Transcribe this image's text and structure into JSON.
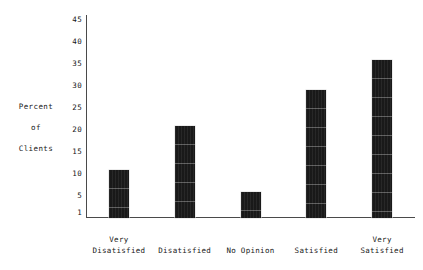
{
  "chart_data": {
    "type": "bar",
    "title": "",
    "subtitle": "",
    "xlabel": "",
    "ylabel": "Percent of Clients",
    "ylabel_lines": [
      "Percent",
      "of",
      "Clients"
    ],
    "categories": [
      "Very Disatisfied",
      "Disatisfied",
      "No Opinion",
      "Satisfied",
      "Very Satisfied"
    ],
    "category_label_lines": [
      [
        "Very",
        "Disatisfied"
      ],
      [
        "Disatisfied"
      ],
      [
        "No Opinion"
      ],
      [
        "Satisfied"
      ],
      [
        "Very",
        "Satisfied"
      ]
    ],
    "values": [
      11,
      21,
      6,
      29,
      36
    ],
    "ylim": [
      1,
      45
    ],
    "yticks": [
      45,
      40,
      35,
      30,
      25,
      20,
      15,
      10,
      5,
      1
    ],
    "ytick_labels": [
      "45",
      "40",
      "35",
      "30",
      "25",
      "20",
      "15",
      "10",
      "5",
      "1"
    ],
    "grid": false,
    "legend": null,
    "bar_color": "#1c1c1c",
    "axis_color": "#4a4a4a",
    "background_color": "#ffffff"
  }
}
